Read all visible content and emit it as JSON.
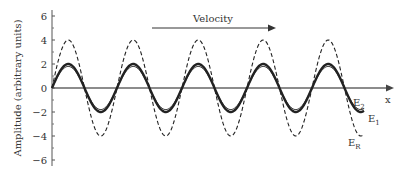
{
  "chart_data": {
    "type": "line",
    "title": "",
    "xlabel": "x",
    "ylabel": "Amplitude (arbitrary units)",
    "ylim": [
      -6,
      6
    ],
    "yticks": [
      "6",
      "4",
      "2",
      "0",
      "−2",
      "−4",
      "−6"
    ],
    "grid": false,
    "annotation": {
      "text": "Velocity",
      "arrow": "right"
    },
    "periods": 4.8,
    "series": [
      {
        "name": "E1",
        "label_main": "E",
        "label_sub": "1",
        "amplitude": 2.0,
        "style": "solid-thick"
      },
      {
        "name": "E2",
        "label_main": "E",
        "label_sub": "2",
        "amplitude": 1.8,
        "style": "solid"
      },
      {
        "name": "ER",
        "label_main": "E",
        "label_sub": "R",
        "amplitude": 4.0,
        "style": "dashed"
      }
    ]
  },
  "axis": {
    "x_label": "x",
    "y_label": "Amplitude (arbitrary units)"
  },
  "annotation": {
    "velocity": "Velocity"
  },
  "colors": {
    "line": "#222222",
    "axis": "#555555",
    "text": "#333333"
  }
}
